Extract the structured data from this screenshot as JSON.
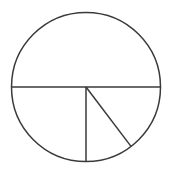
{
  "canvas": {
    "width": 170,
    "height": 178,
    "background_color": "#ffffff"
  },
  "style": {
    "line_color": "#3a3a3a",
    "line_width": 1.5,
    "fill": "none"
  },
  "chart_data": {
    "type": "pie",
    "title": "",
    "subtitle": "",
    "xlabel": "",
    "ylabel": "",
    "legend": [],
    "annotations": [],
    "grid": false,
    "geometry": {
      "center_x": 86,
      "center_y": 87,
      "radius": 74.5,
      "circle_left_x": 11.5,
      "circle_right_x": 160.5,
      "circle_top_y": 12.5,
      "circle_bottom_y": 161.5
    },
    "segments": [
      {
        "name": "upper-semicircle",
        "start_angle_deg": 180,
        "end_angle_deg": 360,
        "sweep_deg": 180,
        "value": 180,
        "fraction": 0.5
      },
      {
        "name": "lower-left-quarter",
        "start_angle_deg": 90,
        "end_angle_deg": 180,
        "sweep_deg": 90,
        "value": 90,
        "fraction": 0.25
      },
      {
        "name": "lower-middle-sector",
        "start_angle_deg": 52.8,
        "end_angle_deg": 90,
        "sweep_deg": 37.2,
        "value": 37,
        "fraction": 0.1033
      },
      {
        "name": "lower-right-sector",
        "start_angle_deg": 0,
        "end_angle_deg": 52.8,
        "sweep_deg": 52.8,
        "value": 53,
        "fraction": 0.1467
      }
    ],
    "categories": [
      "upper-semicircle",
      "lower-left-quarter",
      "lower-middle-sector",
      "lower-right-sector"
    ],
    "values": [
      180,
      90,
      37,
      53
    ],
    "lines": [
      {
        "name": "horizontal-diameter",
        "x1": 11.5,
        "y1": 87,
        "x2": 160.5,
        "y2": 87
      },
      {
        "name": "vertical-radius",
        "x1": 86,
        "y1": 87,
        "x2": 86,
        "y2": 161.5
      },
      {
        "name": "diagonal-radius",
        "x1": 86,
        "y1": 87,
        "x2": 131,
        "y2": 146.4
      }
    ]
  }
}
